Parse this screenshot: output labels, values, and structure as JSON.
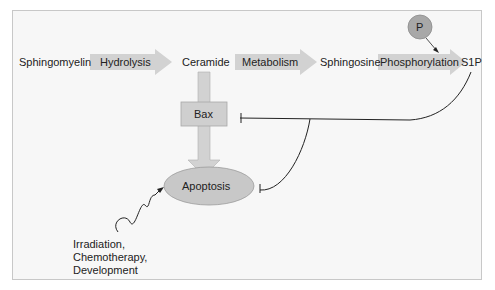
{
  "diagram": {
    "nodes": {
      "sphingomyelin": "Sphingomyelin",
      "ceramide": "Ceramide",
      "sphingosine": "Sphingosine",
      "s1p": "S1P",
      "p": "P",
      "bax": "Bax",
      "apoptosis": "Apoptosis"
    },
    "arrows": {
      "hydrolysis": "Hydrolysis",
      "metabolism": "Metabolism",
      "phosphorylation": "Phosphorylation"
    },
    "stimuli": {
      "line1": "Irradiation,",
      "line2": "Chemotherapy,",
      "line3": "Development"
    },
    "colors": {
      "arrow_fill": "#d2d2d2",
      "node_fill": "#c4c4c4",
      "p_circle": "#a8a8a8",
      "line": "#222222",
      "background": "#f7f7f7"
    }
  }
}
